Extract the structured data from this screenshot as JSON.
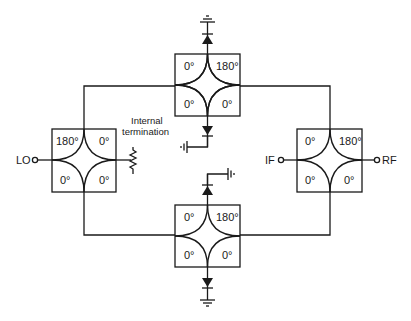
{
  "ports": {
    "lo": "LO",
    "if": "IF",
    "rf": "RF"
  },
  "annotations": {
    "termination_line1": "Internal",
    "termination_line2": "termination"
  },
  "hybrids": [
    {
      "id": "top",
      "tl": "0°",
      "tr": "180°",
      "bl": "0°",
      "br": "0°"
    },
    {
      "id": "left",
      "tl": "180°",
      "tr": "0°",
      "bl": "0°",
      "br": "0°"
    },
    {
      "id": "right",
      "tl": "0°",
      "tr": "180°",
      "bl": "0°",
      "br": "0°"
    },
    {
      "id": "bottom",
      "tl": "0°",
      "tr": "180°",
      "bl": "0°",
      "br": "0°"
    }
  ],
  "components": {
    "diodes": 4,
    "grounds": 4,
    "resistor": "internal-termination-resistor"
  },
  "colors": {
    "line": "#1a1a1a",
    "background": "#ffffff"
  }
}
